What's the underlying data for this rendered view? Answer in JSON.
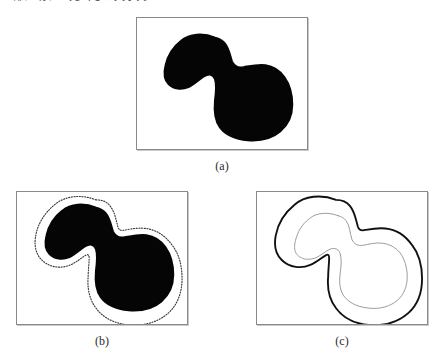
{
  "figure": {
    "header_partial_text": "上部に切れた見出しの文字列",
    "background_color": "#ffffff",
    "panel_border_color": "#8a8a8a",
    "blob_fill_color": "#050505",
    "dotted_contour_color": "#3a3a3a",
    "outer_contour_color": "#111111",
    "inner_contour_color": "#9a9a9a"
  },
  "panels": [
    {
      "id": "a",
      "caption": "(a)",
      "description": "binary-silhouette",
      "content": "solid black bird-shaped blob on white background"
    },
    {
      "id": "b",
      "caption": "(b)",
      "description": "silhouette-with-dotted-contour",
      "content": "black blob with dotted outward-offset contour"
    },
    {
      "id": "c",
      "caption": "(c)",
      "description": "dual-contour-outline",
      "content": "bold outer contour and thin gray inner contour"
    }
  ],
  "shape": {
    "name": "bird-blob",
    "outline_path": "M 74 16 C 62 11, 48 12, 40 19 C 31 26, 26 35, 24 44 C 22 52, 23 59, 27 63 C 32 68, 40 69, 47 66 C 53 63, 58 58, 63 55 C 68 52, 72 53, 74 58 C 76 64, 75 72, 74 80 C 73 90, 74 100, 79 107 C 85 115, 95 119, 107 120 C 120 121, 132 118, 140 111 C 148 104, 152 94, 152 84 C 152 73, 149 63, 144 56 C 139 49, 132 45, 125 44 C 117 43, 109 45, 103 46 C 97 47, 93 45, 91 40 C 89 34, 88 27, 84 22 C 81 18, 78 17, 74 16 Z",
    "offset_path": "M 74 8 C 59 2, 42 4, 32 13 C 21 22, 15 33, 13 44 C 11 54, 13 63, 19 69 C 27 77, 39 78, 48 74 C 55 71, 60 66, 64 64 C 66 63, 67 64, 67 67 C 67 73, 66 79, 66 86 C 65 97, 67 109, 74 118 C 82 129, 95 134, 108 135 C 123 136, 137 132, 147 123 C 157 114, 161 101, 161 88 C 161 75, 158 63, 151 54 C 144 44, 134 38, 124 37 C 115 36, 107 38, 101 39 C 98 39, 97 38, 96 35 C 94 28, 93 20, 88 14 C 84 9, 79 8, 74 8 Z",
    "inner_path": "M 76 24 C 65 20, 54 21, 47 27 C 39 33, 35 41, 33 49 C 31 56, 32 62, 36 65 C 41 69, 47 69, 53 67 C 58 65, 62 61, 66 59 C 71 56, 76 57, 78 62 C 80 68, 79 76, 78 84 C 77 93, 78 101, 83 107 C 89 114, 98 117, 108 118 C 119 119, 129 116, 136 110 C 143 104, 146 95, 146 86 C 146 76, 143 68, 139 62 C 134 56, 128 53, 121 52 C 114 51, 107 53, 102 54 C 96 55, 92 53, 90 48 C 88 42, 88 34, 84 29 C 82 26, 79 25, 76 24 Z"
  }
}
